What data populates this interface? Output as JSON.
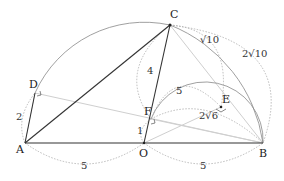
{
  "diagram": {
    "points": [
      {
        "name": "A",
        "x": 25,
        "y": 143
      },
      {
        "name": "O",
        "x": 144,
        "y": 143
      },
      {
        "name": "B",
        "x": 263,
        "y": 143
      },
      {
        "name": "C",
        "x": 170,
        "y": 25
      },
      {
        "name": "D",
        "x": 35,
        "y": 93
      },
      {
        "name": "E",
        "x": 221,
        "y": 107
      },
      {
        "name": "F",
        "x": 151,
        "y": 119
      }
    ],
    "labels": {
      "A": "A",
      "O": "O",
      "B": "B",
      "C": "C",
      "D": "D",
      "E": "E",
      "F": "F"
    },
    "measures": {
      "ad": "2",
      "ao": "5",
      "ob": "5",
      "oc": "4",
      "of": "1",
      "fe": "5",
      "ce": "√10",
      "cb": "2√10",
      "fb": "2√6"
    },
    "colors": {
      "line": "#333333",
      "light": "#c8c8c8",
      "dotted": "#999999"
    }
  }
}
